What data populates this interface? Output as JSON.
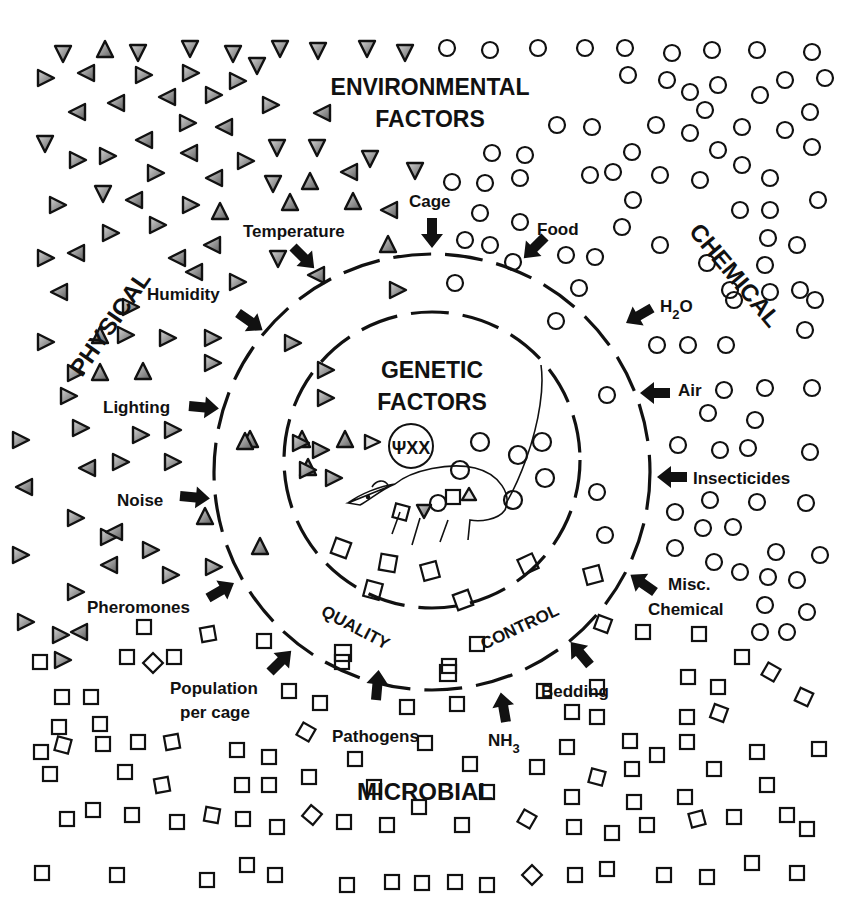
{
  "diagram": {
    "title_line1": "ENVIRONMENTAL",
    "title_line2": "FACTORS",
    "core_line1": "GENETIC",
    "core_line2": "FACTORS",
    "ring_label_left": "QUALITY",
    "ring_label_right": "CONTROL",
    "regions": {
      "physical": "PHYSICAL",
      "chemical": "CHEMICAL",
      "microbial": "MICROBIAL"
    },
    "physical_factors": [
      "Temperature",
      "Humidity",
      "Lighting",
      "Noise",
      "Pheromones"
    ],
    "top_factors": [
      "Cage",
      "Food"
    ],
    "chemical_factors": {
      "h2o": "H",
      "h2o_sub": "2",
      "h2o_end": "O",
      "air": "Air",
      "insecticides": "Insecticides",
      "misc_line1": "Misc.",
      "misc_line2": "Chemical"
    },
    "microbial_factors": {
      "bedding": "Bedding",
      "nh3": "NH",
      "nh3_sub": "3",
      "pathogens": "Pathogens",
      "population_line1": "Population",
      "population_line2": "per cage"
    },
    "symbols": {
      "physical": "triangle",
      "chemical": "circle",
      "microbial": "square",
      "genetic": "chromosome-circle"
    },
    "colors": {
      "ink": "#111111",
      "triangle_fill_light": "#bdbdbd",
      "triangle_fill_dark": "#6e6e6e",
      "background": "#ffffff"
    }
  }
}
